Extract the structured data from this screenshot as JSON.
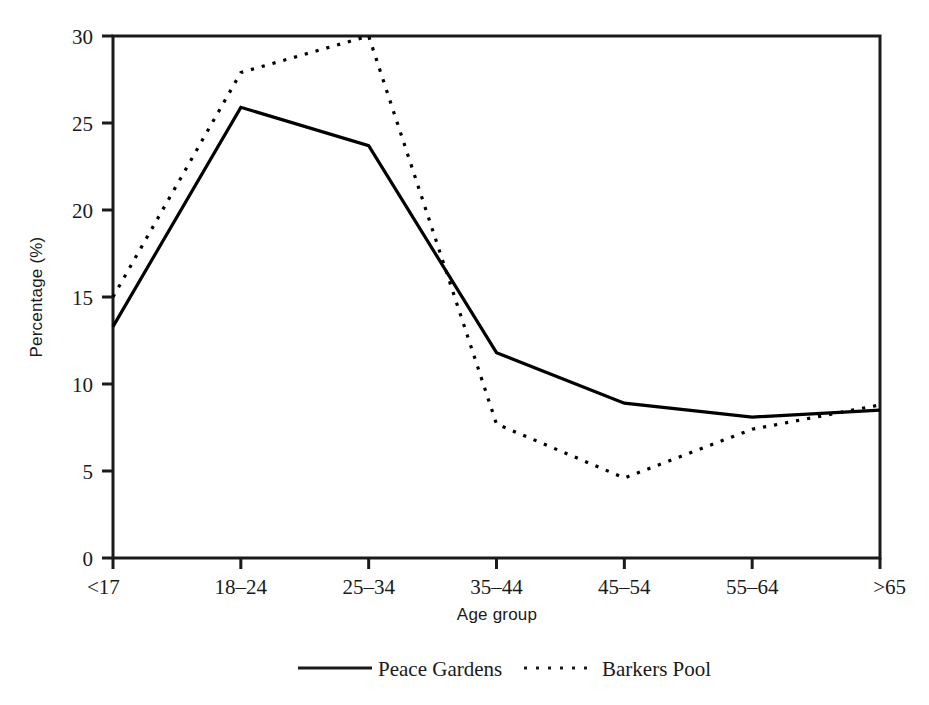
{
  "chart_data": {
    "type": "line",
    "title": "",
    "subtitle": "",
    "xlabel": "Age group",
    "ylabel": "Percentage (%)",
    "categories": [
      "<17",
      "18–24",
      "25–34",
      "35–44",
      "45–54",
      "55–64",
      ">65"
    ],
    "ylim": [
      0,
      30
    ],
    "yticks": [
      "0",
      "5",
      "10",
      "15",
      "20",
      "25",
      "30"
    ],
    "ytick_values": [
      0,
      5,
      10,
      15,
      20,
      25,
      30
    ],
    "grid": false,
    "legend_position": "bottom-center",
    "series": [
      {
        "name": "Peace Gardens",
        "style": "solid",
        "color": "#000000",
        "values": [
          13.3,
          25.9,
          23.7,
          11.8,
          8.9,
          8.1,
          8.5
        ]
      },
      {
        "name": "Barkers Pool",
        "style": "dotted",
        "color": "#000000",
        "values": [
          15.0,
          27.9,
          30.0,
          7.7,
          4.6,
          7.4,
          8.8
        ]
      }
    ]
  },
  "figure": {
    "background_color": "#ffffff",
    "axis_color": "#1a1a1a",
    "frame": "box"
  },
  "legend": {
    "items": [
      {
        "label": "Peace Gardens",
        "style": "solid"
      },
      {
        "label": "Barkers Pool",
        "style": "dotted"
      }
    ]
  }
}
